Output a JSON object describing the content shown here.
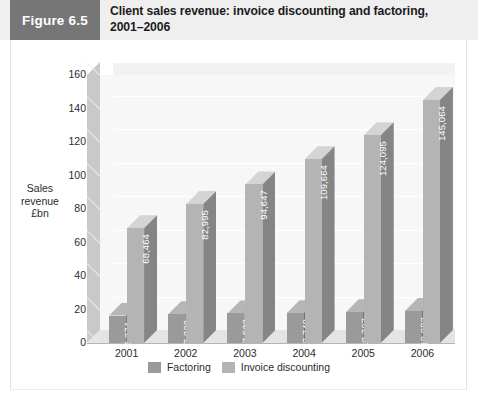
{
  "header": {
    "figure_tag": "Figure 6.5",
    "title": "Client sales revenue: invoice discounting and factoring, 2001–2006",
    "tag_bg": "#767676",
    "band_bg": "#efefef"
  },
  "legend": {
    "position": "bottom-center",
    "items": [
      {
        "label": "Factoring",
        "color": "#9a9a9a"
      },
      {
        "label": "Invoice discounting",
        "color": "#b4b4b4"
      }
    ]
  },
  "axis": {
    "ylabel_lines": [
      "Sales",
      "revenue",
      "£bn"
    ],
    "yticks": [
      "160",
      "140",
      "120",
      "100",
      "80",
      "60",
      "40",
      "20",
      "0"
    ]
  },
  "chart_data": {
    "type": "bar",
    "title": "Client sales revenue: invoice discounting and factoring, 2001–2006",
    "xlabel": "",
    "ylabel": "Sales revenue £bn",
    "ylim": [
      0,
      160
    ],
    "ytick_step": 20,
    "grid": true,
    "legend_position": "bottom-center",
    "three_d": true,
    "categories": [
      "2001",
      "2002",
      "2003",
      "2004",
      "2005",
      "2006"
    ],
    "series": [
      {
        "name": "Factoring",
        "color": "#9a9a9a",
        "labels": [
          "16,374",
          "17,222",
          "17,632",
          "17,740",
          "18,307",
          "19,083"
        ],
        "values": [
          16.374,
          17.222,
          17.632,
          17.74,
          18.307,
          19.083
        ]
      },
      {
        "name": "Invoice discounting",
        "color": "#b4b4b4",
        "labels": [
          "68,464",
          "82,995",
          "94,647",
          "109,664",
          "124,095",
          "145,064"
        ],
        "values": [
          68.464,
          82.995,
          94.647,
          109.664,
          124.095,
          145.064
        ]
      }
    ]
  }
}
